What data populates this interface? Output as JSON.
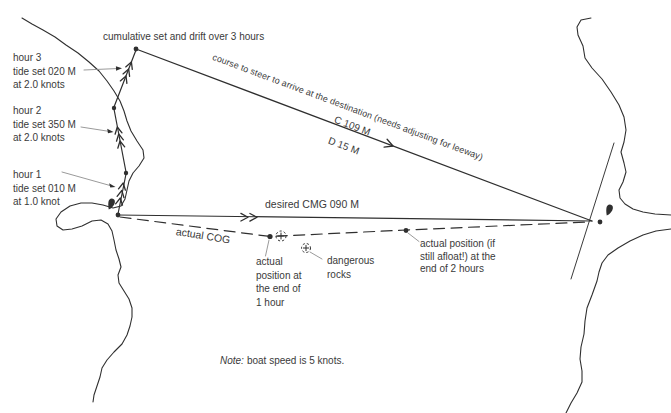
{
  "colors": {
    "ink": "#2f2f2f",
    "text": "#3a3a3a",
    "leader": "#8f8f8f",
    "bg": "#ffffff"
  },
  "title": "cumulative set and drift over 3 hours",
  "tide": {
    "hour3": {
      "line1": "hour 3",
      "line2": "tide set 020 M",
      "line3": "at 2.0 knots"
    },
    "hour2": {
      "line1": "hour 2",
      "line2": "tide set 350 M",
      "line3": "at 2.0 knots"
    },
    "hour1": {
      "line1": "hour 1",
      "line2": "tide set 010 M",
      "line3": "at 1.0 knot"
    }
  },
  "course": {
    "label": "course to steer to arrive at the destination (needs adjusting for leeway)",
    "bearing": "C 109 M",
    "distance": "D 15 M"
  },
  "cmg": {
    "label": "desired CMG 090 M"
  },
  "cog": {
    "label": "actual COG"
  },
  "fix1h": {
    "line1": "actual",
    "line2": "position at",
    "line3": "the end of",
    "line4": "1 hour"
  },
  "rocks": {
    "line1": "dangerous",
    "line2": "rocks"
  },
  "fix2h": {
    "line1": "actual position (if",
    "line2": "still afloat!) at the",
    "line3": "end of 2 hours"
  },
  "note": {
    "prefix": "Note:",
    "text": "boat speed is 5 knots."
  }
}
